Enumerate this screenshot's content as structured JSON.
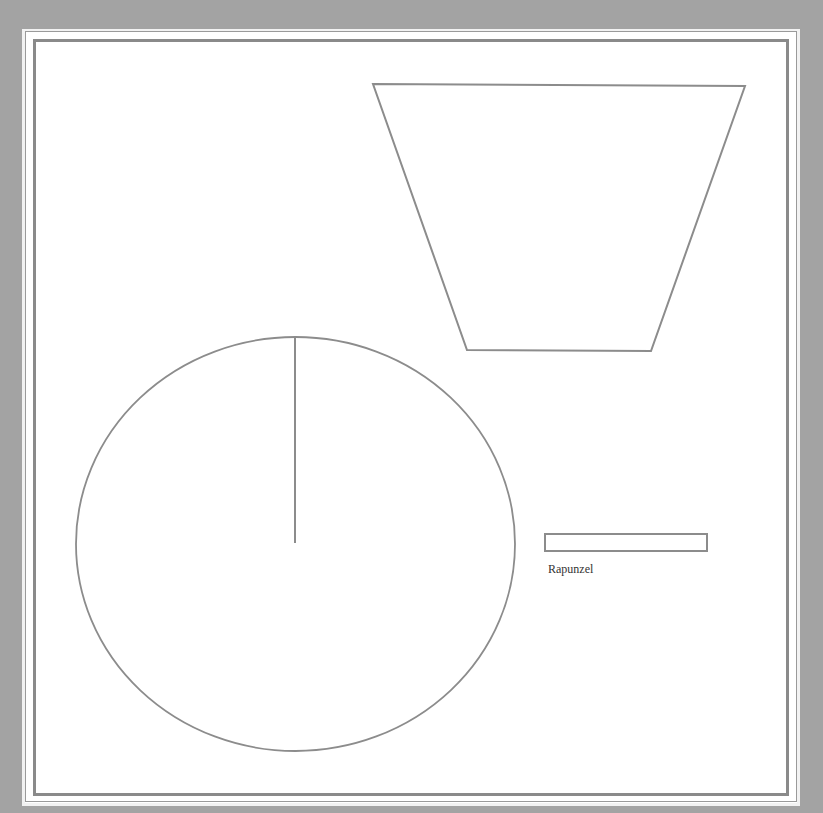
{
  "canvas": {
    "background_color": "#a3a3a3",
    "paper_color": "#ffffff",
    "stroke_color": "#8c8c8c"
  },
  "shapes": {
    "trapezoid": {
      "points": [
        [
          373,
          84
        ],
        [
          745,
          86
        ],
        [
          651,
          351
        ],
        [
          467,
          350
        ]
      ]
    },
    "circle": {
      "cx": 295.5,
      "cy": 544,
      "rx": 219.5,
      "ry": 207,
      "radius_line": {
        "x1": 295,
        "y1": 337,
        "x2": 295,
        "y2": 543
      }
    },
    "bar": {
      "x": 545,
      "y": 534,
      "width": 162,
      "height": 17,
      "label": "Rapunzel"
    }
  }
}
